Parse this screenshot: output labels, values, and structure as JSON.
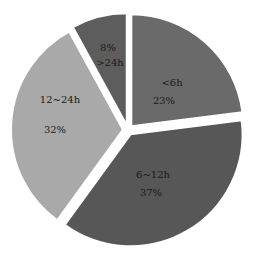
{
  "chart_data": {
    "type": "pie",
    "title": "",
    "exploded": true,
    "start_angle_deg": 0,
    "direction": "clockwise",
    "slices": [
      {
        "category": "<6h",
        "value": 23,
        "label_top": "<6h",
        "label_bottom": "23%",
        "color": "#6a6a6a",
        "label_pos": [
          172,
          85
        ],
        "label_pos2": [
          164,
          104
        ]
      },
      {
        "category": "6~12h",
        "value": 37,
        "label_top": "6~12h",
        "label_bottom": "37%",
        "color": "#575757",
        "label_pos": [
          153,
          177
        ],
        "label_pos2": [
          152,
          195
        ]
      },
      {
        "category": "12~24h",
        "value": 32,
        "label_top": "12~24h",
        "label_bottom": "32%",
        "color": "#a9a9a9",
        "label_pos": [
          60,
          101
        ],
        "label_pos2": [
          55,
          132
        ]
      },
      {
        "category": ">24h",
        "value": 8,
        "label_top": "8%",
        "label_bottom": ">24h",
        "color": "#5d5d5d",
        "label_pos": [
          108,
          50
        ],
        "label_pos2": [
          110,
          65
        ]
      }
    ],
    "categories": [
      "<6h",
      "6~12h",
      "12~24h",
      ">24h"
    ],
    "values": [
      23,
      37,
      32,
      8
    ],
    "units": "%",
    "legend": "none"
  }
}
